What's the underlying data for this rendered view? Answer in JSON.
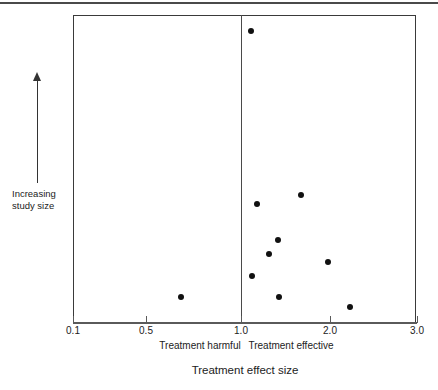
{
  "figure": {
    "kind": "funnel-plot",
    "background_color": "#ffffff",
    "marker_color": "#111111",
    "axis_color": "#4a4a4a"
  },
  "y_axis": {
    "arrow_direction": "up",
    "caption_line1": "Increasing",
    "caption_line2": "study size"
  },
  "x_axis": {
    "title": "Treatment effect size",
    "left_region_label": "Treatment harmful",
    "right_region_label": "Treatment effective",
    "reference_value": "1.0",
    "ticks": [
      {
        "label": "0.1",
        "px": 73
      },
      {
        "label": "0.5",
        "px": 146
      },
      {
        "label": "1.0",
        "px": 241
      },
      {
        "label": "2.0",
        "px": 330
      },
      {
        "label": "3.0",
        "px": 417
      }
    ]
  },
  "chart_data": {
    "type": "scatter",
    "title": "",
    "subtitle": "",
    "xlabel": "Treatment effect size",
    "ylabel": "Increasing study size",
    "xlim": [
      0.1,
      3.0
    ],
    "xticks": [
      0.1,
      0.5,
      1.0,
      2.0,
      3.0
    ],
    "xtick_labels": [
      "0.1",
      "0.5",
      "1.0",
      "2.0",
      "3.0"
    ],
    "grid": false,
    "legend": null,
    "annotations": [
      {
        "text": "Treatment harmful",
        "x": 0.55,
        "position": "below-axis-left"
      },
      {
        "text": "Treatment effective",
        "x": 1.6,
        "position": "below-axis-right"
      },
      {
        "text": "Increasing study size",
        "position": "left-of-axis",
        "arrow": "up"
      }
    ],
    "reference_lines": [
      {
        "orientation": "vertical",
        "value": 1.0,
        "style": "solid",
        "color": "#4a4a4a"
      }
    ],
    "series": [
      {
        "name": "studies",
        "marker": "filled-circle",
        "color": "#111111",
        "points": [
          {
            "x": 1.1,
            "y_px": 31,
            "px": 251
          },
          {
            "x": 1.7,
            "y_px": 195,
            "px": 301
          },
          {
            "x": 1.2,
            "y_px": 204,
            "px": 257
          },
          {
            "x": 1.4,
            "y_px": 240,
            "px": 278
          },
          {
            "x": 1.3,
            "y_px": 254,
            "px": 269
          },
          {
            "x": 2.0,
            "y_px": 262,
            "px": 328
          },
          {
            "x": 1.12,
            "y_px": 276,
            "px": 252
          },
          {
            "x": 0.68,
            "y_px": 297,
            "px": 181
          },
          {
            "x": 1.42,
            "y_px": 297,
            "px": 279
          },
          {
            "x": 2.25,
            "y_px": 307,
            "px": 350
          }
        ]
      }
    ]
  }
}
